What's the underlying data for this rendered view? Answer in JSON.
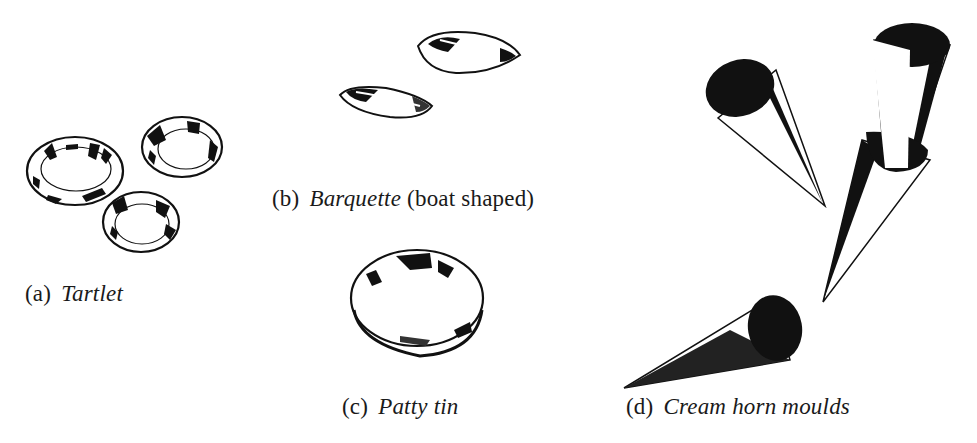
{
  "figure": {
    "panels": [
      {
        "id": "a",
        "letter": "(a)",
        "name": "Tartlet",
        "note": "",
        "item_count": 3
      },
      {
        "id": "b",
        "letter": "(b)",
        "name": "Barquette",
        "note": "(boat shaped)",
        "item_count": 2
      },
      {
        "id": "c",
        "letter": "(c)",
        "name": "Patty tin",
        "note": "",
        "item_count": 1
      },
      {
        "id": "d",
        "letter": "(d)",
        "name": "Cream horn moulds",
        "note": "",
        "item_count": 4
      }
    ],
    "colors": {
      "ink": "#111111",
      "paper": "#ffffff"
    }
  }
}
